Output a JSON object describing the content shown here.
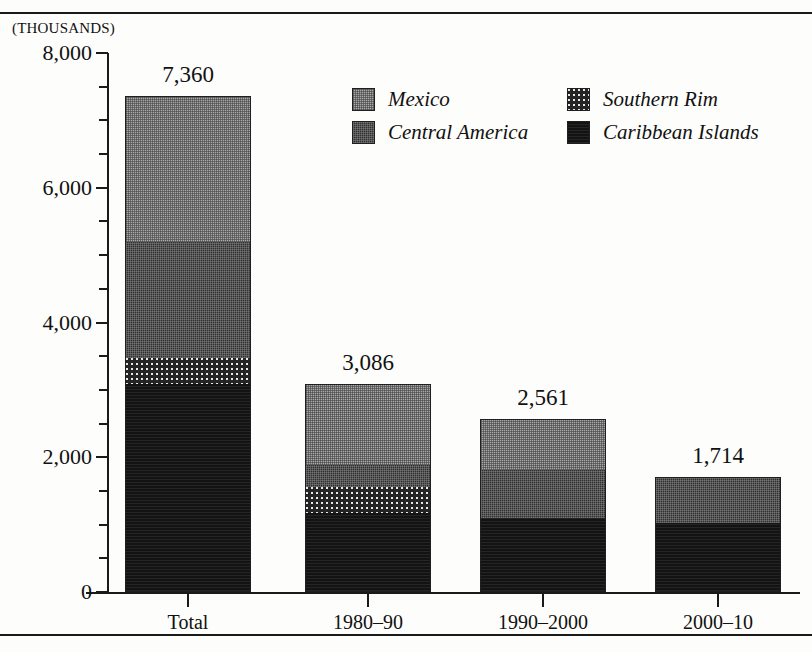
{
  "axis_units_note": "(THOUSANDS)",
  "legend": {
    "items": [
      {
        "label": "Mexico",
        "key": "mexico",
        "swatch": "mexico-swatch"
      },
      {
        "label": "Southern Rim",
        "key": "southern",
        "swatch": "southern-rim-swatch"
      },
      {
        "label": "Central America",
        "key": "central",
        "swatch": "central-america-swatch"
      },
      {
        "label": "Caribbean Islands",
        "key": "caribbean",
        "swatch": "caribbean-islands-swatch"
      }
    ]
  },
  "chart_data": {
    "type": "bar",
    "subtype": "stacked",
    "title": "",
    "xlabel": "",
    "ylabel": "(THOUSANDS)",
    "ylim": [
      0,
      8000
    ],
    "ytick_labels": [
      "0",
      "2,000",
      "4,000",
      "6,000",
      "8,000"
    ],
    "ytick_values": [
      0,
      2000,
      4000,
      6000,
      8000
    ],
    "yminor_step": 500,
    "grid": false,
    "legend_position": "upper-right-inside",
    "categories": [
      "Total",
      "1980–90",
      "1990–2000",
      "2000–10"
    ],
    "totals": [
      7360,
      3086,
      2561,
      1714
    ],
    "total_labels": [
      "7,360",
      "3,086",
      "2,561",
      "1,714"
    ],
    "series": [
      {
        "name": "Caribbean Islands",
        "key": "caribbean",
        "values": [
          3078,
          1175,
          1100,
          1025
        ]
      },
      {
        "name": "Southern Rim",
        "key": "southern",
        "values": [
          400,
          390,
          0,
          0
        ]
      },
      {
        "name": "Central America",
        "key": "central",
        "values": [
          1725,
          330,
          715,
          689
        ]
      },
      {
        "name": "Mexico",
        "key": "mexico",
        "values": [
          2157,
          1191,
          746,
          0
        ]
      }
    ],
    "stack_order_bottom_to_top": [
      "caribbean",
      "southern",
      "central",
      "mexico"
    ]
  }
}
